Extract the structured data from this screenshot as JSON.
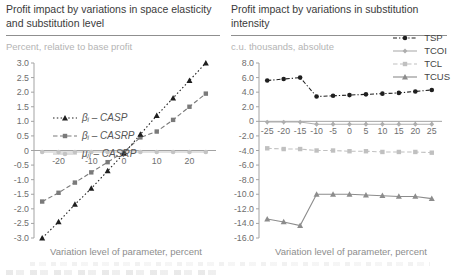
{
  "chart_data": [
    {
      "type": "line",
      "title": "Profit impact by variations in space elasticity and substitution level",
      "title_lines": [
        "Profit impact by variations in space elasticity",
        "and substitution level"
      ],
      "subtitle": "Percent, relative to base profit",
      "xlabel": "Variation level of parameter, percent",
      "ylabel": "Percent, relative to base profit",
      "x": [
        -25,
        -20,
        -15,
        -10,
        -5,
        0,
        5,
        10,
        15,
        20,
        25
      ],
      "xlim": [
        -27.5,
        27.5
      ],
      "ylim": [
        -3.0,
        3.0
      ],
      "grid": false,
      "legend_position": "top-left",
      "ytick_values": [
        3.0,
        2.5,
        2.0,
        1.5,
        1.0,
        0.5,
        0,
        -0.5,
        -1.0,
        -1.5,
        -2.0,
        -2.5,
        -3.0
      ],
      "ytick_labels": [
        "3.0",
        "2.5",
        "2.0",
        "1.5",
        "1.0",
        "0.5",
        "0",
        "-0.5",
        "-1.0",
        "-1.5",
        "-2.0",
        "-2.5",
        "-3.0"
      ],
      "xtick_marks": [
        -25,
        -20,
        -15,
        -10,
        -5,
        0,
        5,
        10,
        15,
        20,
        25
      ],
      "xtick_label_values": [
        -20,
        -10,
        0,
        10,
        20
      ],
      "xtick_labels": [
        "-20",
        "-10",
        "0",
        "10",
        "20"
      ],
      "series": [
        {
          "name": "βᵢ – CASP",
          "marker": "triangle",
          "color": "#1f1f1f",
          "line": "dotted",
          "values": [
            -3.0,
            -2.45,
            -1.85,
            -1.3,
            -0.7,
            -0.1,
            0.55,
            1.2,
            1.8,
            2.4,
            3.0
          ]
        },
        {
          "name": "βᵢ – CASRP",
          "marker": "square",
          "color": "#7a7a7a",
          "line": "dashed",
          "values": [
            -1.75,
            -1.45,
            -1.1,
            -0.75,
            -0.4,
            -0.05,
            0.45,
            0.65,
            1.05,
            1.5,
            1.95
          ]
        },
        {
          "name": "μⱼᵢ – CASRP",
          "marker": "circle",
          "color": "#c4c4c4",
          "line": "solid",
          "values": [
            -0.05,
            -0.05,
            -0.05,
            -0.05,
            -0.05,
            -0.05,
            -0.05,
            -0.05,
            -0.05,
            -0.05,
            -0.05
          ]
        }
      ]
    },
    {
      "type": "line",
      "title": "Profit impact by variations in substitution intensity",
      "title_lines": [
        "Profit impact by variations in substitution",
        "intensity"
      ],
      "subtitle": "c.u. thousands, absolute",
      "xlabel": "Variation level of parameter, percent",
      "ylabel": "c.u. thousands, absolute",
      "x": [
        -25,
        -20,
        -15,
        -10,
        -5,
        0,
        5,
        10,
        15,
        20,
        25
      ],
      "xlim": [
        -27.5,
        27.5
      ],
      "ylim": [
        -16.0,
        8.0
      ],
      "grid": false,
      "legend_position": "top-right",
      "ytick_values": [
        8.0,
        6.0,
        4.0,
        2.0,
        0,
        -2.0,
        -4.0,
        -6.0,
        -8.0,
        -10.0,
        -12.0,
        -14.0,
        -16.0
      ],
      "ytick_labels": [
        "8.0",
        "6.0",
        "4.0",
        "2.0",
        "0",
        "-2.0",
        "-4.0",
        "-6.0",
        "-8.0",
        "-10.0",
        "-12.0",
        "-14.0",
        "-16.0"
      ],
      "xtick_marks": [
        -25,
        -20,
        -15,
        -10,
        -5,
        0,
        5,
        10,
        15,
        20,
        25
      ],
      "xtick_label_values": [
        -25,
        -20,
        -15,
        -10,
        -5,
        0,
        5,
        10,
        15,
        20,
        25
      ],
      "xtick_labels": [
        "-25",
        "-20",
        "-15",
        "-10",
        "-5",
        "0",
        "5",
        "10",
        "15",
        "20",
        "25"
      ],
      "series": [
        {
          "name": "TSP",
          "marker": "circle",
          "color": "#1f1f1f",
          "line": "dashdot",
          "values": [
            5.6,
            5.8,
            6.0,
            3.4,
            3.5,
            3.6,
            3.7,
            3.8,
            3.9,
            4.1,
            4.3
          ]
        },
        {
          "name": "TCOI",
          "marker": "diamond",
          "color": "#aeaeae",
          "line": "solid",
          "values": [
            -0.1,
            -0.1,
            -0.1,
            -0.4,
            -0.4,
            -0.4,
            -0.4,
            -0.4,
            -0.4,
            -0.4,
            -0.4
          ]
        },
        {
          "name": "TCL",
          "marker": "square",
          "color": "#c0c0c0",
          "line": "dashed",
          "values": [
            -3.7,
            -3.8,
            -3.8,
            -4.0,
            -4.0,
            -4.1,
            -4.1,
            -4.2,
            -4.2,
            -4.2,
            -4.3
          ]
        },
        {
          "name": "TCUS",
          "marker": "triangle",
          "color": "#8c8c8c",
          "line": "solid",
          "values": [
            -13.4,
            -13.8,
            -14.3,
            -10.0,
            -10.0,
            -10.0,
            -10.1,
            -10.2,
            -10.3,
            -10.3,
            -10.6
          ]
        }
      ]
    }
  ]
}
